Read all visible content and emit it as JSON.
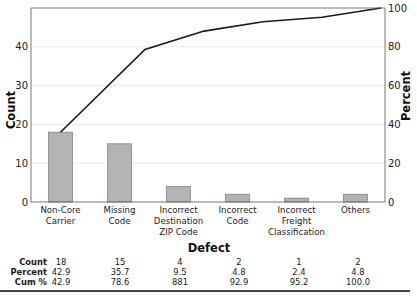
{
  "chart_data": {
    "type": "pareto",
    "title": "",
    "xlabel": "Defect",
    "ylabel_left": "Count",
    "ylabel_right": "Percent",
    "categories": [
      [
        "Non-Core",
        "Carrier"
      ],
      [
        "Missing",
        "Code"
      ],
      [
        "Incorrect",
        "Destination",
        "ZIP Code"
      ],
      [
        "Incorrect",
        "Code"
      ],
      [
        "Incorrect",
        "Freight",
        "Classification"
      ],
      [
        "Others"
      ]
    ],
    "category_names": [
      "Non-Core Carrier",
      "Missing Code",
      "Incorrect Destination ZIP Code",
      "Incorrect Code",
      "Incorrect Freight Classification",
      "Others"
    ],
    "series": [
      {
        "name": "Count",
        "type": "bar",
        "values": [
          18,
          15,
          4,
          2,
          1,
          2
        ]
      },
      {
        "name": "Cum %",
        "type": "line",
        "values": [
          42.9,
          78.6,
          88.1,
          92.9,
          95.2,
          100.0
        ]
      }
    ],
    "left_ticks": [
      "0",
      "10",
      "20",
      "30",
      "40"
    ],
    "right_ticks": [
      "0",
      "20",
      "40",
      "60",
      "80",
      "100"
    ],
    "ylim_left": [
      0,
      50
    ],
    "ylim_right": [
      0,
      100
    ],
    "grid": true,
    "table": {
      "rows": [
        {
          "label": "Count",
          "values": [
            "18",
            "15",
            "4",
            "2",
            "1",
            "2"
          ]
        },
        {
          "label": "Percent",
          "values": [
            "42.9",
            "35.7",
            "9.5",
            "4.8",
            "2.4",
            "4.8"
          ]
        },
        {
          "label": "Cum %",
          "values": [
            "42.9",
            "78.6",
            "881",
            "92.9",
            "95.2",
            "100.0"
          ]
        }
      ]
    },
    "colors": {
      "bar_fill": "#b3b3b3",
      "bar_stroke": "#7a7a7a",
      "line": "#1a1a1a",
      "grid": "#e3e3e3",
      "axis": "#555555"
    }
  }
}
